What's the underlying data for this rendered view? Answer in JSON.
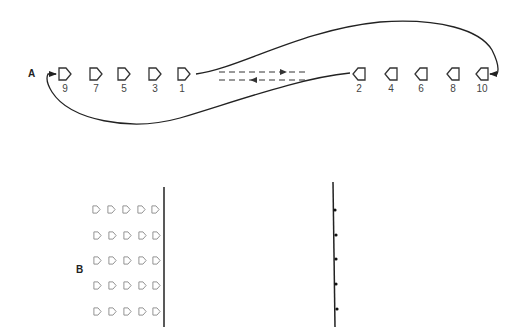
{
  "diagram": {
    "panel_a": {
      "label": "A",
      "left_row": {
        "direction": "right",
        "markers": [
          {
            "number": "9",
            "x": 65
          },
          {
            "number": "7",
            "x": 96
          },
          {
            "number": "5",
            "x": 124
          },
          {
            "number": "3",
            "x": 155
          },
          {
            "number": "1",
            "x": 184
          }
        ]
      },
      "right_row": {
        "direction": "left",
        "markers": [
          {
            "number": "2",
            "x": 359
          },
          {
            "number": "4",
            "x": 391
          },
          {
            "number": "6",
            "x": 421
          },
          {
            "number": "8",
            "x": 453
          },
          {
            "number": "10",
            "x": 482
          }
        ]
      },
      "dashed_arrows": [
        {
          "direction": "right",
          "label": "forward"
        },
        {
          "direction": "left",
          "label": "return"
        }
      ]
    },
    "panel_b": {
      "label": "B",
      "grid": {
        "rows": 5,
        "columns": 5
      },
      "right_line_dots": 5
    },
    "colors": {
      "stroke": "#222222",
      "marker_light": "#888888"
    }
  }
}
